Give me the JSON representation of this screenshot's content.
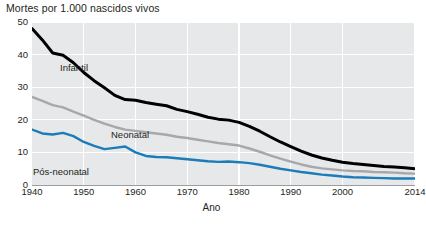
{
  "chart_data": {
    "type": "line",
    "title": "Mortes por 1.000 nascidos vivos",
    "xlabel": "Ano",
    "ylabel": "",
    "xlim": [
      1940,
      2014
    ],
    "ylim": [
      0,
      50
    ],
    "grid": true,
    "legend_position": "inline-annotations",
    "y_ticks": [
      "0",
      "10",
      "20",
      "30",
      "40",
      "50"
    ],
    "y_tick_values": [
      0,
      10,
      20,
      30,
      40,
      50
    ],
    "x_ticks": [
      "1940",
      "1950",
      "1960",
      "1970",
      "1980",
      "1990",
      "2000",
      "2014"
    ],
    "x_tick_values": [
      1940,
      1950,
      1960,
      1970,
      1980,
      1990,
      2000,
      2014
    ],
    "x": [
      1940,
      1942,
      1944,
      1946,
      1948,
      1950,
      1952,
      1954,
      1956,
      1958,
      1960,
      1962,
      1964,
      1966,
      1968,
      1970,
      1972,
      1974,
      1976,
      1978,
      1980,
      1982,
      1984,
      1986,
      1988,
      1990,
      1992,
      1994,
      1996,
      1998,
      2000,
      2002,
      2004,
      2006,
      2008,
      2010,
      2012,
      2014
    ],
    "series": [
      {
        "name": "Infantil",
        "color": "#000000",
        "values": [
          48.0,
          44.5,
          40.5,
          39.8,
          37.5,
          34.5,
          32.0,
          29.8,
          27.5,
          26.2,
          26.0,
          25.3,
          24.8,
          24.3,
          23.2,
          22.5,
          21.7,
          20.8,
          20.2,
          19.9,
          19.2,
          18.0,
          16.5,
          14.8,
          13.2,
          11.8,
          10.4,
          9.2,
          8.3,
          7.6,
          7.0,
          6.6,
          6.3,
          6.0,
          5.7,
          5.5,
          5.3,
          5.0
        ]
      },
      {
        "name": "Neonatal",
        "color": "#a6a8ab",
        "values": [
          27.0,
          25.8,
          24.5,
          23.8,
          22.5,
          21.3,
          20.0,
          18.8,
          17.8,
          17.0,
          16.6,
          16.2,
          15.8,
          15.4,
          14.8,
          14.4,
          13.9,
          13.4,
          12.9,
          12.5,
          12.1,
          11.2,
          10.2,
          9.1,
          8.1,
          7.2,
          6.3,
          5.6,
          5.1,
          4.8,
          4.5,
          4.3,
          4.2,
          4.0,
          3.9,
          3.8,
          3.6,
          3.5
        ]
      },
      {
        "name": "Pós-neonatal",
        "color": "#1b7cb8",
        "values": [
          17.0,
          15.8,
          15.5,
          16.0,
          15.0,
          13.2,
          12.0,
          11.0,
          11.4,
          11.8,
          10.0,
          8.9,
          8.6,
          8.5,
          8.2,
          7.9,
          7.6,
          7.3,
          7.1,
          7.2,
          7.0,
          6.7,
          6.2,
          5.6,
          5.0,
          4.5,
          4.0,
          3.6,
          3.2,
          2.9,
          2.6,
          2.4,
          2.3,
          2.2,
          2.1,
          2.0,
          2.0,
          2.0
        ]
      }
    ]
  },
  "annotations": [
    {
      "text": "Infantil"
    },
    {
      "text": "Neonatal"
    },
    {
      "text": "Pós-neonatal"
    }
  ]
}
